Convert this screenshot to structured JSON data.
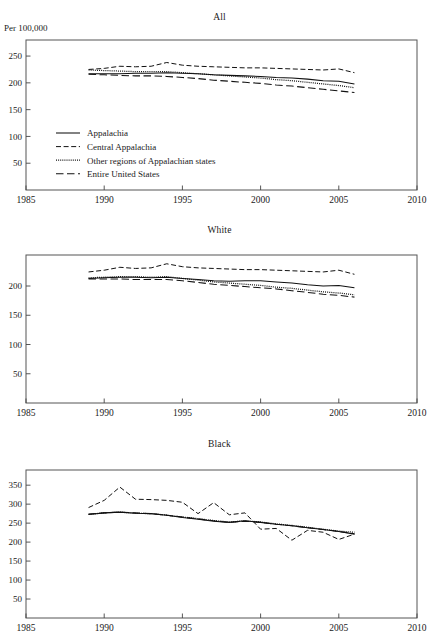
{
  "figure": {
    "yaxis_label": "Per 100,000",
    "xlim": [
      1985,
      2010
    ],
    "xticks": [
      1985,
      1990,
      1995,
      2000,
      2005,
      2010
    ],
    "legend_position": "inside-lower-left-panel-1"
  },
  "series_styles": {
    "appalachia": "solid",
    "central_appalachia": "dashed",
    "other_regions": "dotted",
    "entire_us": "long-dashed"
  },
  "legend": {
    "items": [
      {
        "label": "Appalachia",
        "style": "solid"
      },
      {
        "label": "Central Appalachia",
        "style": "dashed"
      },
      {
        "label": "Other regions of Appalachian states",
        "style": "dotted"
      },
      {
        "label": "Entire United States",
        "style": "long-dashed"
      }
    ]
  },
  "chart_data": [
    {
      "type": "line",
      "title": "All",
      "xlabel": "",
      "ylabel": "Per 100,000",
      "xlim": [
        1985,
        2010
      ],
      "ylim": [
        0,
        280
      ],
      "xticks": [
        1985,
        1990,
        1995,
        2000,
        2005,
        2010
      ],
      "yticks": [
        50,
        100,
        150,
        200,
        250
      ],
      "grid": false,
      "x": [
        1989,
        1990,
        1991,
        1992,
        1993,
        1994,
        1995,
        1996,
        1997,
        1998,
        1999,
        2000,
        2001,
        2002,
        2003,
        2004,
        2005,
        2006
      ],
      "series": [
        {
          "name": "Appalachia",
          "style": "solid",
          "values": [
            217,
            217,
            217,
            218,
            218,
            219,
            218,
            217,
            215,
            214,
            213,
            212,
            210,
            209,
            207,
            204,
            203,
            198
          ]
        },
        {
          "name": "Central Appalachia",
          "style": "dashed",
          "values": [
            225,
            227,
            231,
            230,
            231,
            238,
            233,
            231,
            230,
            229,
            228,
            228,
            227,
            226,
            225,
            224,
            226,
            219
          ]
        },
        {
          "name": "Other regions of Appalachian states",
          "style": "dotted",
          "values": [
            224,
            223,
            222,
            221,
            221,
            221,
            219,
            217,
            215,
            213,
            211,
            209,
            206,
            204,
            201,
            198,
            195,
            191
          ]
        },
        {
          "name": "Entire United States",
          "style": "long-dashed",
          "values": [
            216,
            215,
            214,
            213,
            213,
            212,
            210,
            208,
            205,
            203,
            201,
            199,
            196,
            194,
            191,
            188,
            185,
            182
          ]
        }
      ]
    },
    {
      "type": "line",
      "title": "White",
      "xlabel": "",
      "ylabel": "",
      "xlim": [
        1985,
        2010
      ],
      "ylim": [
        0,
        253
      ],
      "xticks": [
        1985,
        1990,
        1995,
        2000,
        2005,
        2010
      ],
      "yticks": [
        50,
        100,
        150,
        200
      ],
      "grid": false,
      "x": [
        1989,
        1990,
        1991,
        1992,
        1993,
        1994,
        1995,
        1996,
        1997,
        1998,
        1999,
        2000,
        2001,
        2002,
        2003,
        2004,
        2005,
        2006
      ],
      "series": [
        {
          "name": "Appalachia",
          "style": "solid",
          "values": [
            213,
            214,
            215,
            215,
            214,
            215,
            213,
            211,
            209,
            208,
            209,
            209,
            207,
            205,
            202,
            200,
            201,
            197
          ]
        },
        {
          "name": "Central Appalachia",
          "style": "dashed",
          "values": [
            224,
            227,
            232,
            230,
            231,
            238,
            233,
            231,
            230,
            229,
            228,
            228,
            227,
            226,
            225,
            224,
            227,
            220
          ]
        },
        {
          "name": "Other regions of Appalachian states",
          "style": "dotted",
          "values": [
            214,
            215,
            216,
            216,
            215,
            216,
            213,
            210,
            207,
            205,
            203,
            201,
            198,
            196,
            193,
            190,
            188,
            185
          ]
        },
        {
          "name": "Entire United States",
          "style": "long-dashed",
          "values": [
            212,
            212,
            212,
            211,
            211,
            211,
            209,
            206,
            203,
            201,
            199,
            197,
            195,
            192,
            189,
            186,
            184,
            181
          ]
        }
      ]
    },
    {
      "type": "line",
      "title": "Black",
      "xlabel": "",
      "ylabel": "",
      "xlim": [
        1985,
        2010
      ],
      "ylim": [
        0,
        390
      ],
      "xticks": [
        1985,
        1990,
        1995,
        2000,
        2005,
        2010
      ],
      "yticks": [
        50,
        100,
        150,
        200,
        250,
        300,
        350
      ],
      "grid": false,
      "x": [
        1989,
        1990,
        1991,
        1992,
        1993,
        1994,
        1995,
        1996,
        1997,
        1998,
        1999,
        2000,
        2001,
        2002,
        2003,
        2004,
        2005,
        2006
      ],
      "series": [
        {
          "name": "Appalachia",
          "style": "solid",
          "values": [
            273,
            277,
            279,
            276,
            275,
            271,
            265,
            260,
            255,
            252,
            256,
            252,
            247,
            243,
            238,
            233,
            228,
            221
          ]
        },
        {
          "name": "Central Appalachia",
          "style": "dashed",
          "values": [
            291,
            310,
            345,
            313,
            312,
            310,
            305,
            275,
            304,
            272,
            277,
            234,
            236,
            205,
            231,
            226,
            207,
            221
          ]
        },
        {
          "name": "Other regions of Appalachian states",
          "style": "dotted",
          "values": [
            273,
            277,
            279,
            276,
            275,
            271,
            266,
            262,
            257,
            253,
            256,
            253,
            248,
            244,
            239,
            234,
            229,
            226
          ]
        },
        {
          "name": "Entire United States",
          "style": "long-dashed",
          "values": [
            274,
            277,
            279,
            277,
            275,
            271,
            266,
            261,
            256,
            252,
            255,
            252,
            247,
            243,
            238,
            233,
            228,
            222
          ]
        }
      ]
    }
  ]
}
